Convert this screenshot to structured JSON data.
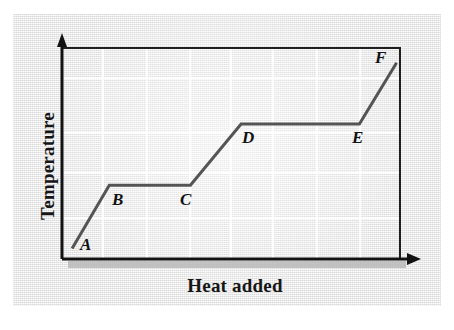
{
  "figure": {
    "title": "",
    "background_color": "#eeeeee",
    "line_color": "#545454",
    "axis_color": "#1a1a1a",
    "grid_color": "#ffffff",
    "shadow_color": "#b4b4b4"
  },
  "axes": {
    "y_title": "Temperature",
    "x_title": "Heat added"
  },
  "chart_data": {
    "type": "line",
    "title": "",
    "xlabel": "Heat added",
    "ylabel": "Temperature",
    "grid": true,
    "legend": "none",
    "xlim": [
      0,
      100
    ],
    "ylim": [
      0,
      100
    ],
    "axis_ticks": "none",
    "series": [
      {
        "name": "heating curve",
        "points": [
          {
            "label": "A",
            "x": 3,
            "y": 5
          },
          {
            "label": "B",
            "x": 14,
            "y": 35
          },
          {
            "label": "C",
            "x": 38,
            "y": 35
          },
          {
            "label": "D",
            "x": 53,
            "y": 64
          },
          {
            "label": "E",
            "x": 88,
            "y": 64
          },
          {
            "label": "F",
            "x": 99,
            "y": 93
          }
        ]
      }
    ],
    "annotations": [
      {
        "text": "A",
        "x": 3,
        "y": 5,
        "placement": "below-right"
      },
      {
        "text": "B",
        "x": 14,
        "y": 35,
        "placement": "below-right"
      },
      {
        "text": "C",
        "x": 38,
        "y": 35,
        "placement": "below-left"
      },
      {
        "text": "D",
        "x": 53,
        "y": 64,
        "placement": "below-right"
      },
      {
        "text": "E",
        "x": 88,
        "y": 64,
        "placement": "below-left"
      },
      {
        "text": "F",
        "x": 99,
        "y": 93,
        "placement": "above-left"
      }
    ]
  },
  "labels": {
    "a": "A",
    "b": "B",
    "c": "C",
    "d": "D",
    "e": "E",
    "f": "F"
  }
}
